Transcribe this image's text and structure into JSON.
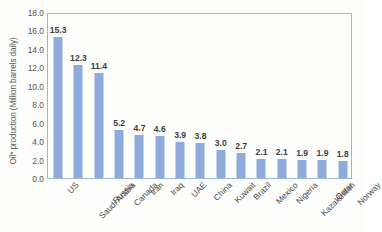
{
  "chart_data": {
    "type": "bar",
    "title": "",
    "xlabel": "",
    "ylabel": "Oil* production (Million barrels daily)",
    "ylim": [
      0.0,
      18.0
    ],
    "ytick_step": 2.0,
    "yticks": [
      "0.0",
      "2.0",
      "4.0",
      "6.0",
      "8.0",
      "10.0",
      "12.0",
      "14.0",
      "16.0",
      "18.0"
    ],
    "grid": false,
    "legend": "none",
    "label_rotation_deg": 45,
    "categories": [
      "US",
      "Saudi Arabia",
      "Russia",
      "Canada",
      "Iran",
      "Iraq",
      "UAE",
      "China",
      "Kuwait",
      "Brazil",
      "Mexico",
      "Nigeria",
      "Kazakhstan",
      "Qatar",
      "Norway"
    ],
    "values": [
      15.3,
      12.3,
      11.4,
      5.2,
      4.7,
      4.6,
      3.9,
      3.8,
      3.0,
      2.7,
      2.1,
      2.1,
      1.9,
      1.9,
      1.8
    ],
    "value_labels": [
      "15.3",
      "12.3",
      "11.4",
      "5.2",
      "4.7",
      "4.6",
      "3.9",
      "3.8",
      "3.0",
      "2.7",
      "2.1",
      "2.1",
      "1.9",
      "1.9",
      "1.8"
    ],
    "colors": {
      "bar": "#8faadc",
      "plot_border": "#9db7d9",
      "value_label": "#3f3f3f",
      "tick_label": "#555555",
      "axis_title": "#5a5a5a",
      "background": "#fdfdfc"
    }
  }
}
